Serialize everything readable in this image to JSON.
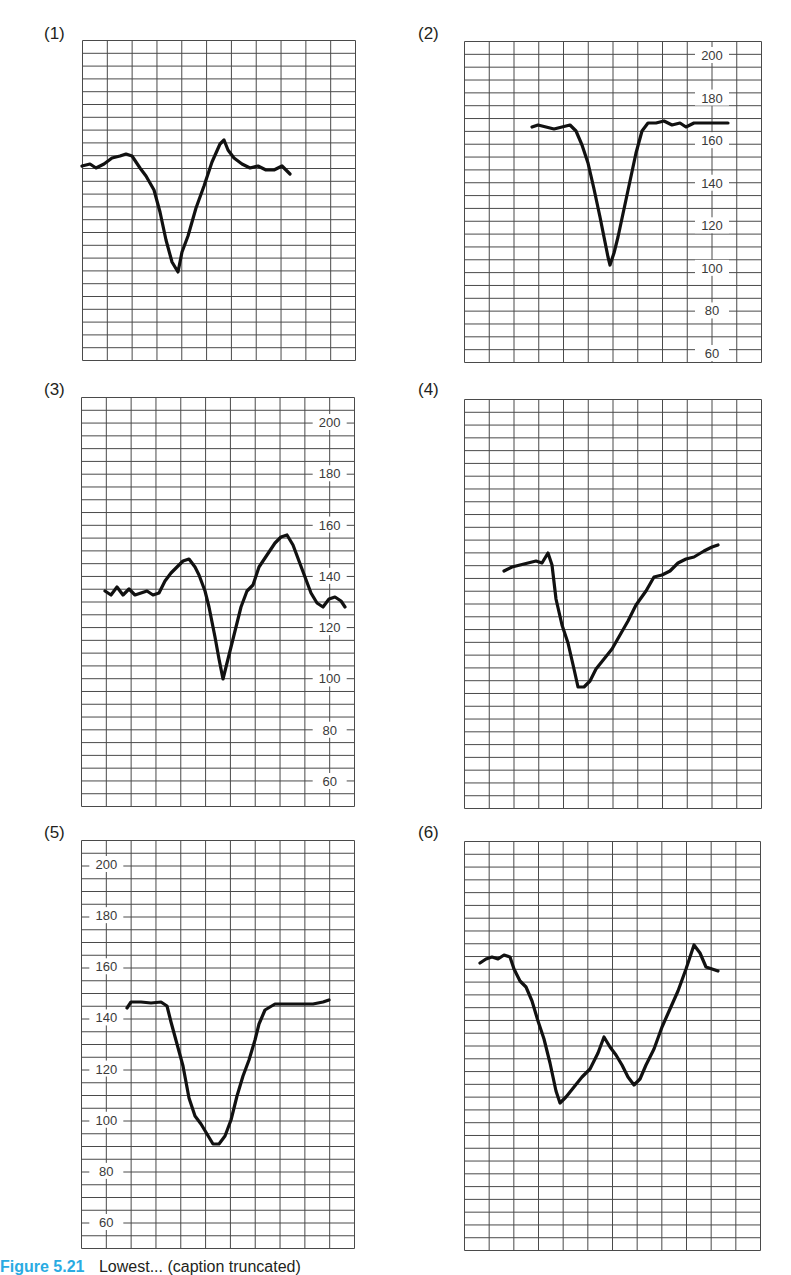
{
  "figure": {
    "caption_label": "Figure 5.21",
    "caption_text": "Lowest... (caption truncated)"
  },
  "colors": {
    "grid": "#4a4a4a",
    "trace": "#111111",
    "caption_accent": "#29abe2",
    "text": "#231f20"
  },
  "chart_data": [
    {
      "id": "1",
      "label": "(1)",
      "type": "line",
      "box": {
        "x": 82,
        "y": 40,
        "w": 273,
        "h": 320
      },
      "cols": 11,
      "rows": 25,
      "axis": null,
      "y_ticks": [],
      "trace_px": [
        [
          0,
          126
        ],
        [
          8,
          124
        ],
        [
          14,
          128
        ],
        [
          22,
          124
        ],
        [
          30,
          118
        ],
        [
          38,
          116
        ],
        [
          44,
          114
        ],
        [
          50,
          116
        ],
        [
          58,
          128
        ],
        [
          64,
          136
        ],
        [
          72,
          150
        ],
        [
          78,
          172
        ],
        [
          84,
          200
        ],
        [
          90,
          222
        ],
        [
          96,
          232
        ],
        [
          100,
          212
        ],
        [
          106,
          196
        ],
        [
          114,
          168
        ],
        [
          122,
          146
        ],
        [
          130,
          122
        ],
        [
          138,
          104
        ],
        [
          142,
          100
        ],
        [
          146,
          110
        ],
        [
          152,
          118
        ],
        [
          160,
          124
        ],
        [
          168,
          128
        ],
        [
          176,
          126
        ],
        [
          184,
          130
        ],
        [
          192,
          130
        ],
        [
          200,
          126
        ],
        [
          208,
          134
        ]
      ]
    },
    {
      "id": "2",
      "label": "(2)",
      "type": "line",
      "box": {
        "x": 464,
        "y": 41,
        "w": 297,
        "h": 321
      },
      "cols": 12,
      "rows": 25,
      "axis": {
        "label_col": 10,
        "min": 60,
        "max": 200,
        "y_at_max": 14,
        "y_at_min": 312
      },
      "y_ticks": [
        "200",
        "180",
        "160",
        "140",
        "120",
        "100",
        "80",
        "60"
      ],
      "values": {
        "baseline_before": 166,
        "nadir": 97,
        "baseline_after": 169
      },
      "trace_px": [
        [
          68,
          86
        ],
        [
          74,
          84
        ],
        [
          82,
          86
        ],
        [
          90,
          88
        ],
        [
          98,
          86
        ],
        [
          106,
          84
        ],
        [
          112,
          90
        ],
        [
          118,
          104
        ],
        [
          124,
          122
        ],
        [
          130,
          148
        ],
        [
          136,
          176
        ],
        [
          140,
          196
        ],
        [
          144,
          216
        ],
        [
          146,
          224
        ],
        [
          150,
          212
        ],
        [
          154,
          196
        ],
        [
          160,
          168
        ],
        [
          166,
          140
        ],
        [
          172,
          112
        ],
        [
          178,
          90
        ],
        [
          184,
          82
        ],
        [
          192,
          82
        ],
        [
          200,
          80
        ],
        [
          208,
          84
        ],
        [
          216,
          82
        ],
        [
          222,
          86
        ],
        [
          230,
          82
        ],
        [
          240,
          82
        ],
        [
          250,
          82
        ],
        [
          264,
          82
        ]
      ]
    },
    {
      "id": "3",
      "label": "(3)",
      "type": "line",
      "box": {
        "x": 81,
        "y": 397,
        "w": 273,
        "h": 409
      },
      "cols": 11,
      "rows": 32,
      "axis": {
        "label_col": 10,
        "min": 60,
        "max": 200,
        "y_at_max": 25,
        "y_at_min": 384
      },
      "y_ticks": [
        "200",
        "180",
        "160",
        "140",
        "120",
        "100",
        "80",
        "60"
      ],
      "values": {
        "baseline_before": 131,
        "peak1": 146,
        "nadir": 94,
        "peak2": 160,
        "baseline_after": 130
      },
      "trace_px": [
        [
          24,
          194
        ],
        [
          30,
          198
        ],
        [
          36,
          190
        ],
        [
          42,
          198
        ],
        [
          48,
          192
        ],
        [
          54,
          198
        ],
        [
          60,
          196
        ],
        [
          66,
          194
        ],
        [
          72,
          198
        ],
        [
          78,
          196
        ],
        [
          84,
          184
        ],
        [
          90,
          176
        ],
        [
          96,
          170
        ],
        [
          102,
          164
        ],
        [
          108,
          162
        ],
        [
          114,
          170
        ],
        [
          118,
          178
        ],
        [
          124,
          194
        ],
        [
          128,
          210
        ],
        [
          134,
          240
        ],
        [
          138,
          262
        ],
        [
          142,
          282
        ],
        [
          148,
          258
        ],
        [
          154,
          234
        ],
        [
          160,
          210
        ],
        [
          166,
          194
        ],
        [
          172,
          188
        ],
        [
          178,
          170
        ],
        [
          186,
          158
        ],
        [
          194,
          146
        ],
        [
          200,
          140
        ],
        [
          206,
          138
        ],
        [
          212,
          148
        ],
        [
          218,
          164
        ],
        [
          224,
          180
        ],
        [
          230,
          196
        ],
        [
          236,
          206
        ],
        [
          242,
          210
        ],
        [
          248,
          202
        ],
        [
          254,
          200
        ],
        [
          260,
          204
        ],
        [
          264,
          210
        ]
      ]
    },
    {
      "id": "4",
      "label": "(4)",
      "type": "line",
      "box": {
        "x": 464,
        "y": 399,
        "w": 297,
        "h": 409
      },
      "cols": 12,
      "rows": 32,
      "axis": null,
      "y_ticks": [],
      "trace_px": [
        [
          40,
          172
        ],
        [
          48,
          168
        ],
        [
          56,
          166
        ],
        [
          64,
          164
        ],
        [
          72,
          162
        ],
        [
          78,
          164
        ],
        [
          84,
          154
        ],
        [
          88,
          166
        ],
        [
          92,
          200
        ],
        [
          98,
          226
        ],
        [
          104,
          244
        ],
        [
          110,
          270
        ],
        [
          114,
          288
        ],
        [
          120,
          288
        ],
        [
          126,
          282
        ],
        [
          132,
          270
        ],
        [
          140,
          260
        ],
        [
          148,
          250
        ],
        [
          156,
          236
        ],
        [
          164,
          222
        ],
        [
          172,
          206
        ],
        [
          182,
          192
        ],
        [
          190,
          178
        ],
        [
          198,
          176
        ],
        [
          206,
          172
        ],
        [
          214,
          164
        ],
        [
          222,
          160
        ],
        [
          230,
          158
        ],
        [
          240,
          152
        ],
        [
          248,
          148
        ],
        [
          254,
          146
        ]
      ]
    },
    {
      "id": "5",
      "label": "(5)",
      "type": "line",
      "box": {
        "x": 81,
        "y": 840,
        "w": 273,
        "h": 408
      },
      "cols": 11,
      "rows": 32,
      "axis": {
        "label_col": 1,
        "min": 60,
        "max": 200,
        "y_at_max": 24,
        "y_at_min": 382
      },
      "y_ticks": [
        "200",
        "180",
        "160",
        "140",
        "120",
        "100",
        "80",
        "60"
      ],
      "values": {
        "baseline_before": 147,
        "nadir": 84,
        "baseline_after": 151
      },
      "trace_px": [
        [
          46,
          168
        ],
        [
          50,
          162
        ],
        [
          60,
          162
        ],
        [
          70,
          163
        ],
        [
          80,
          162
        ],
        [
          86,
          166
        ],
        [
          90,
          182
        ],
        [
          96,
          204
        ],
        [
          102,
          226
        ],
        [
          108,
          258
        ],
        [
          114,
          276
        ],
        [
          120,
          284
        ],
        [
          126,
          294
        ],
        [
          132,
          304
        ],
        [
          138,
          304
        ],
        [
          144,
          296
        ],
        [
          150,
          280
        ],
        [
          156,
          256
        ],
        [
          162,
          236
        ],
        [
          168,
          220
        ],
        [
          174,
          200
        ],
        [
          178,
          184
        ],
        [
          184,
          170
        ],
        [
          194,
          164
        ],
        [
          204,
          164
        ],
        [
          214,
          164
        ],
        [
          224,
          164
        ],
        [
          232,
          164
        ],
        [
          242,
          162
        ],
        [
          248,
          160
        ]
      ]
    },
    {
      "id": "6",
      "label": "(6)",
      "type": "line",
      "box": {
        "x": 464,
        "y": 841,
        "w": 296,
        "h": 409
      },
      "cols": 12,
      "rows": 32,
      "axis": null,
      "y_ticks": [],
      "trace_px": [
        [
          16,
          122
        ],
        [
          22,
          118
        ],
        [
          28,
          116
        ],
        [
          34,
          118
        ],
        [
          40,
          114
        ],
        [
          46,
          116
        ],
        [
          50,
          128
        ],
        [
          56,
          140
        ],
        [
          62,
          146
        ],
        [
          68,
          160
        ],
        [
          74,
          180
        ],
        [
          80,
          198
        ],
        [
          86,
          222
        ],
        [
          92,
          250
        ],
        [
          96,
          262
        ],
        [
          102,
          256
        ],
        [
          110,
          246
        ],
        [
          118,
          236
        ],
        [
          126,
          228
        ],
        [
          134,
          212
        ],
        [
          140,
          196
        ],
        [
          146,
          206
        ],
        [
          152,
          214
        ],
        [
          158,
          224
        ],
        [
          164,
          236
        ],
        [
          170,
          244
        ],
        [
          176,
          238
        ],
        [
          182,
          224
        ],
        [
          190,
          208
        ],
        [
          198,
          186
        ],
        [
          206,
          168
        ],
        [
          214,
          150
        ],
        [
          222,
          128
        ],
        [
          230,
          104
        ],
        [
          236,
          112
        ],
        [
          242,
          126
        ],
        [
          248,
          128
        ],
        [
          254,
          130
        ]
      ]
    }
  ]
}
